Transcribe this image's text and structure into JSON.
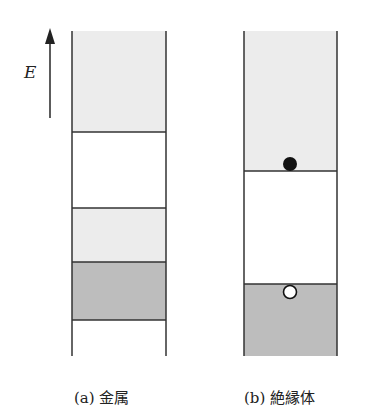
{
  "axis": {
    "label": "E",
    "direction": "up"
  },
  "panels": [
    {
      "id": "a",
      "caption": "(a) 金属",
      "bands": [
        {
          "name": "upper-band",
          "fill": "light"
        },
        {
          "name": "gap",
          "fill": "white"
        },
        {
          "name": "partially-filled-band-upper",
          "fill": "light"
        },
        {
          "name": "partially-filled-band-lower",
          "fill": "dark"
        },
        {
          "name": "bottom",
          "fill": "white"
        }
      ]
    },
    {
      "id": "b",
      "caption": "(b) 絶縁体",
      "bands": [
        {
          "name": "conduction-band",
          "fill": "light"
        },
        {
          "name": "band-gap",
          "fill": "white"
        },
        {
          "name": "valence-band",
          "fill": "dark"
        }
      ],
      "markers": [
        {
          "name": "electron",
          "type": "filled-circle"
        },
        {
          "name": "hole",
          "type": "open-circle"
        }
      ]
    }
  ],
  "colors": {
    "light_band": "#ececec",
    "dark_band": "#bdbdbd",
    "line": "#333333"
  }
}
